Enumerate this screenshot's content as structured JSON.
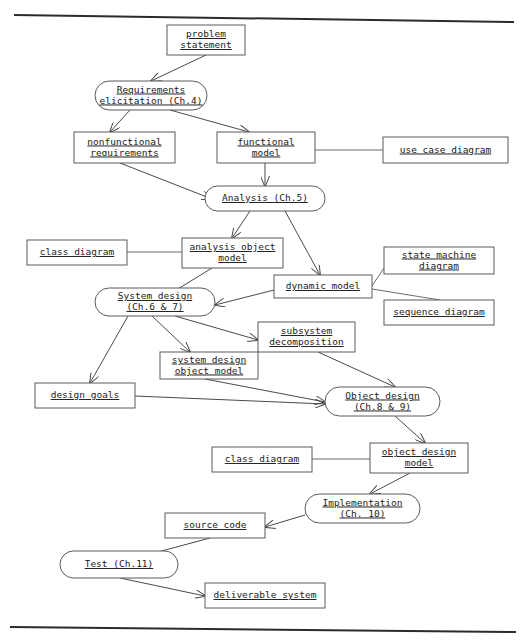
{
  "document": {
    "title": "Software Engineering Development Activities Flow Diagram",
    "type": "scanned-textbook-figure",
    "background_color": "#ffffff",
    "line_color": "#4a4a4a",
    "text_color": "#1a1a1a"
  },
  "page_edges": {
    "top_line_label": "scanned page top edge",
    "bottom_line_label": "scanned page bottom edge"
  },
  "nodes": [
    {
      "id": "problem_statement",
      "label_lines": [
        "problem",
        "statement"
      ],
      "shape": "rect",
      "x": 167,
      "y": 25,
      "w": 78,
      "h": 30
    },
    {
      "id": "requirements_elicitation",
      "label_lines": [
        "Requirements",
        "elicitation (Ch.4)"
      ],
      "shape": "round",
      "x": 95,
      "y": 81,
      "w": 112,
      "h": 29
    },
    {
      "id": "nonfunctional_requirements",
      "label_lines": [
        "nonfunctional",
        "requirements"
      ],
      "shape": "rect",
      "x": 74,
      "y": 132,
      "w": 101,
      "h": 31
    },
    {
      "id": "functional_model",
      "label_lines": [
        "functional",
        "model"
      ],
      "shape": "rect",
      "x": 217,
      "y": 132,
      "w": 98,
      "h": 31
    },
    {
      "id": "use_case_diagram",
      "label_lines": [
        "use case diagram"
      ],
      "shape": "rect",
      "x": 383,
      "y": 137,
      "w": 125,
      "h": 26
    },
    {
      "id": "analysis",
      "label_lines": [
        "Analysis (Ch.5)"
      ],
      "shape": "round",
      "x": 205,
      "y": 186,
      "w": 120,
      "h": 25
    },
    {
      "id": "class_diagram_1",
      "label_lines": [
        "class diagram"
      ],
      "shape": "rect",
      "x": 27,
      "y": 240,
      "w": 100,
      "h": 25
    },
    {
      "id": "analysis_object_model",
      "label_lines": [
        "analysis object",
        "model"
      ],
      "shape": "rect",
      "x": 182,
      "y": 238,
      "w": 101,
      "h": 30
    },
    {
      "id": "state_machine_diagram",
      "label_lines": [
        "state machine",
        "diagram"
      ],
      "shape": "rect",
      "x": 384,
      "y": 247,
      "w": 110,
      "h": 27
    },
    {
      "id": "dynamic_model",
      "label_lines": [
        "dynamic model"
      ],
      "shape": "rect",
      "x": 274,
      "y": 275,
      "w": 98,
      "h": 23
    },
    {
      "id": "sequence_diagram",
      "label_lines": [
        "sequence diagram"
      ],
      "shape": "rect",
      "x": 384,
      "y": 300,
      "w": 110,
      "h": 25
    },
    {
      "id": "system_design",
      "label_lines": [
        "System design",
        "(Ch.6 & 7)"
      ],
      "shape": "round",
      "x": 95,
      "y": 288,
      "w": 120,
      "h": 28
    },
    {
      "id": "subsystem_decomposition",
      "label_lines": [
        "subsystem",
        "decomposition"
      ],
      "shape": "rect",
      "x": 258,
      "y": 322,
      "w": 97,
      "h": 30
    },
    {
      "id": "system_design_object_model",
      "label_lines": [
        "system design",
        "object model"
      ],
      "shape": "rect",
      "x": 160,
      "y": 352,
      "w": 98,
      "h": 27
    },
    {
      "id": "design_goals",
      "label_lines": [
        "design goals"
      ],
      "shape": "rect",
      "x": 35,
      "y": 383,
      "w": 100,
      "h": 25
    },
    {
      "id": "object_design",
      "label_lines": [
        "Object design",
        "(Ch.8 & 9)"
      ],
      "shape": "round",
      "x": 325,
      "y": 387,
      "w": 115,
      "h": 29
    },
    {
      "id": "class_diagram_2",
      "label_lines": [
        "class diagram"
      ],
      "shape": "rect",
      "x": 212,
      "y": 447,
      "w": 100,
      "h": 25
    },
    {
      "id": "object_design_model",
      "label_lines": [
        "object design",
        "model"
      ],
      "shape": "rect",
      "x": 370,
      "y": 443,
      "w": 98,
      "h": 30
    },
    {
      "id": "implementation",
      "label_lines": [
        "Implementation",
        "(Ch. 10)"
      ],
      "shape": "round",
      "x": 305,
      "y": 494,
      "w": 115,
      "h": 29
    },
    {
      "id": "source_code",
      "label_lines": [
        "source code"
      ],
      "shape": "rect",
      "x": 165,
      "y": 513,
      "w": 100,
      "h": 25
    },
    {
      "id": "test",
      "label_lines": [
        "Test (Ch.11)"
      ],
      "shape": "round",
      "x": 60,
      "y": 551,
      "w": 118,
      "h": 27
    },
    {
      "id": "deliverable_system",
      "label_lines": [
        "deliverable system"
      ],
      "shape": "rect",
      "x": 205,
      "y": 583,
      "w": 120,
      "h": 25
    }
  ],
  "edges": [
    {
      "from": "problem_statement",
      "to": "requirements_elicitation",
      "arrow": true,
      "path": "M 206 55 L 151 81"
    },
    {
      "from": "requirements_elicitation",
      "to": "nonfunctional_requirements",
      "arrow": true,
      "path": "M 130 110 L 110 132"
    },
    {
      "from": "requirements_elicitation",
      "to": "functional_model",
      "arrow": true,
      "path": "M 170 110 L 249 132"
    },
    {
      "from": "functional_model",
      "to": "use_case_diagram",
      "arrow": false,
      "path": "M 315 150 L 383 150"
    },
    {
      "from": "nonfunctional_requirements",
      "to": "analysis",
      "arrow": true,
      "path": "M 120 163 L 212 199"
    },
    {
      "from": "functional_model",
      "to": "analysis",
      "arrow": true,
      "path": "M 265 163 L 265 186"
    },
    {
      "from": "analysis",
      "to": "analysis_object_model",
      "arrow": true,
      "path": "M 250 211 L 232 238"
    },
    {
      "from": "analysis",
      "to": "dynamic_model",
      "arrow": true,
      "path": "M 285 211 L 320 275"
    },
    {
      "from": "class_diagram_1",
      "to": "analysis_object_model",
      "arrow": false,
      "path": "M 127 252 L 182 252"
    },
    {
      "from": "analysis_object_model",
      "to": "system_design",
      "arrow": true,
      "path": "M 212 268 L 160 300"
    },
    {
      "from": "dynamic_model",
      "to": "system_design",
      "arrow": true,
      "path": "M 274 290 L 215 305"
    },
    {
      "from": "state_machine_diagram",
      "to": "dynamic_model",
      "arrow": false,
      "path": "M 384 268 L 372 286"
    },
    {
      "from": "dynamic_model",
      "to": "sequence_diagram",
      "arrow": false,
      "path": "M 372 289 L 440 300"
    },
    {
      "from": "system_design",
      "to": "subsystem_decomposition",
      "arrow": true,
      "path": "M 175 316 L 258 340"
    },
    {
      "from": "system_design",
      "to": "design_goals",
      "arrow": true,
      "path": "M 128 316 L 90 383"
    },
    {
      "from": "system_design",
      "to": "system_design_object_model",
      "arrow": true,
      "path": "M 152 316 L 190 352"
    },
    {
      "from": "subsystem_decomposition",
      "to": "object_design",
      "arrow": true,
      "path": "M 318 352 L 395 387"
    },
    {
      "from": "system_design_object_model",
      "to": "object_design",
      "arrow": true,
      "path": "M 205 379 L 325 402"
    },
    {
      "from": "design_goals",
      "to": "object_design",
      "arrow": true,
      "path": "M 135 396 L 325 404"
    },
    {
      "from": "object_design",
      "to": "object_design_model",
      "arrow": true,
      "path": "M 395 416 L 425 443"
    },
    {
      "from": "class_diagram_2",
      "to": "object_design_model",
      "arrow": false,
      "path": "M 312 459 L 370 459"
    },
    {
      "from": "object_design_model",
      "to": "implementation",
      "arrow": true,
      "path": "M 410 473 L 370 494"
    },
    {
      "from": "implementation",
      "to": "source_code",
      "arrow": true,
      "path": "M 305 515 L 265 527"
    },
    {
      "from": "source_code",
      "to": "test",
      "arrow": true,
      "path": "M 210 538 L 128 560"
    },
    {
      "from": "test",
      "to": "deliverable_system",
      "arrow": true,
      "path": "M 120 578 L 205 596"
    }
  ]
}
